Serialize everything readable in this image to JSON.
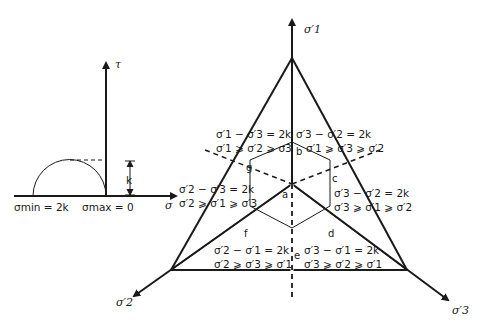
{
  "mohr_circle": {
    "tau_axis_label": "τ",
    "sigma_axis_label": "σ",
    "sigma_min_label": "σmin = 2k",
    "sigma_max_label": "σmax = 0",
    "radius_label": "k"
  },
  "pi_plane": {
    "axes": {
      "sigma1": "σ′1",
      "sigma2": "σ′2",
      "sigma3": "σ′3"
    },
    "points": [
      "a",
      "b",
      "c",
      "d",
      "e",
      "f",
      "g"
    ],
    "regions": [
      {
        "id": "top-left",
        "criterion": "σ′1 − σ′3 = 2k",
        "ordering": "σ′1 ⩾ σ′2 ⩾ σ3"
      },
      {
        "id": "top-right",
        "criterion": "σ′3 − σ′2 = 2k",
        "ordering": "σ′1 ⩾ σ′3 ⩾ σ′2"
      },
      {
        "id": "left",
        "criterion": "σ′2 − σ′3 = 2k",
        "ordering": "σ′2 ⩾ σ′1 ⩾ σ′3"
      },
      {
        "id": "right",
        "criterion": "σ′3 − σ′2 = 2k",
        "ordering": "σ′3 ⩾ σ′1 ⩾ σ′2"
      },
      {
        "id": "bottom-left",
        "criterion": "σ′2 − σ′1 = 2k",
        "ordering": "σ′2 ⩾ σ′3 ⩾ σ′1"
      },
      {
        "id": "bottom-right",
        "criterion": "σ′3 − σ′1 = 2k",
        "ordering": "σ′3 ⩾ σ′2 ⩾ σ′1"
      }
    ]
  }
}
